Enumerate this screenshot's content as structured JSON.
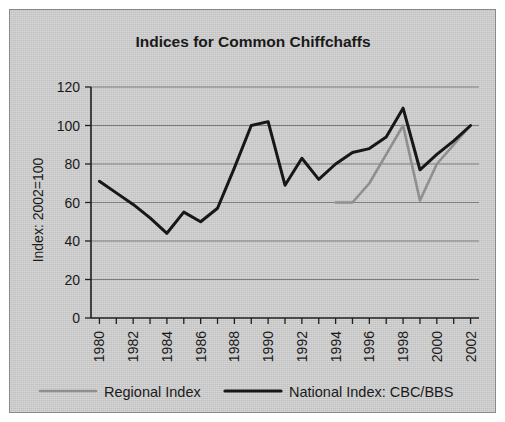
{
  "figure": {
    "panel_background": "#cdcdcd",
    "border_color": "#8a8a8a"
  },
  "chart_data": {
    "type": "line",
    "title": "Indices for Common Chiffchaffs",
    "xlabel": "",
    "ylabel": "Index: 2002=100",
    "xlim": [
      1979.5,
      2002.5
    ],
    "ylim": [
      0,
      120
    ],
    "yticks": [
      0,
      20,
      40,
      60,
      80,
      100,
      120
    ],
    "ytick_labels": [
      "0",
      "20",
      "40",
      "60",
      "80",
      "100",
      "120"
    ],
    "x": [
      1980,
      1981,
      1982,
      1983,
      1984,
      1985,
      1986,
      1987,
      1988,
      1989,
      1990,
      1991,
      1992,
      1993,
      1994,
      1995,
      1996,
      1997,
      1998,
      1999,
      2000,
      2001,
      2002
    ],
    "xticks": [
      1980,
      1982,
      1984,
      1986,
      1988,
      1990,
      1992,
      1994,
      1996,
      1998,
      2000,
      2002
    ],
    "xtick_labels": [
      "1980",
      "1982",
      "1984",
      "1986",
      "1988",
      "1990",
      "1992",
      "1994",
      "1996",
      "1998",
      "2000",
      "2002"
    ],
    "grid": true,
    "grid_axis": "y",
    "legend_position": "bottom",
    "series": [
      {
        "name": "Regional Index",
        "color": "#8f8f8f",
        "width": 2.6,
        "values": [
          null,
          null,
          null,
          null,
          null,
          null,
          null,
          null,
          null,
          null,
          null,
          null,
          null,
          null,
          60,
          60,
          70,
          85,
          100,
          61,
          80,
          90,
          100
        ]
      },
      {
        "name": "National Index: CBC/BBS",
        "color": "#171717",
        "width": 3.0,
        "values": [
          71,
          65,
          59,
          52,
          44,
          55,
          50,
          57,
          78,
          100,
          102,
          69,
          83,
          72,
          80,
          86,
          88,
          94,
          109,
          77,
          85,
          92,
          100
        ]
      }
    ]
  },
  "legend": {
    "items": [
      {
        "label": "Regional Index",
        "color": "#8f8f8f"
      },
      {
        "label": "National Index: CBC/BBS",
        "color": "#171717"
      }
    ]
  }
}
